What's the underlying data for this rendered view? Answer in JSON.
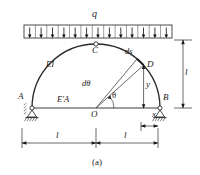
{
  "figure": {
    "caption": "(a)",
    "type": "two-hinged semicircular arch with tie rod under uniform distributed load"
  },
  "labels": {
    "load": "q",
    "crown": "C",
    "left_support": "A",
    "right_support": "B",
    "arch_stiffness": "EI",
    "tie_stiffness": "E'A",
    "origin": "O",
    "point_d": "D",
    "arc_element": "ds",
    "angle": "θ",
    "angle_increment": "dθ",
    "ordinate": "y",
    "abscissa": "x",
    "span_half_left": "l",
    "span_half_right": "l",
    "rise": "l"
  },
  "geometry": {
    "origin_x": 96,
    "origin_y": 108,
    "radius": 64,
    "theta_deg": 42,
    "dtheta_deg": 58,
    "load_arrow_count": 13,
    "load_box_left": 24,
    "load_box_right": 172,
    "load_box_top": 25,
    "load_box_bottom": 38
  },
  "colors": {
    "ink": "#1a1a1a",
    "line": "#3a3a3a",
    "arch": "#2b2b2b",
    "background": "#ffffff"
  }
}
